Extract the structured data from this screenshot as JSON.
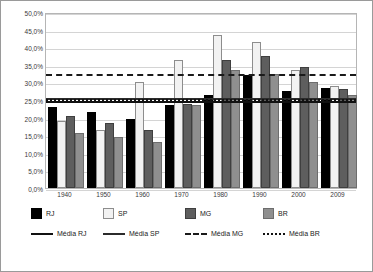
{
  "chart_data": {
    "type": "bar",
    "title": "",
    "xlabel": "",
    "ylabel": "",
    "ylim": [
      0,
      50
    ],
    "grid": true,
    "legend_position": "bottom",
    "categories": [
      "1940",
      "1950",
      "1960",
      "1970",
      "1980",
      "1990",
      "2000",
      "2009"
    ],
    "series": [
      {
        "name": "RJ",
        "values": [
          23.0,
          21.5,
          19.5,
          23.5,
          26.5,
          32.0,
          27.5,
          28.5
        ]
      },
      {
        "name": "SP",
        "values": [
          19.0,
          16.5,
          30.0,
          36.5,
          43.5,
          41.5,
          33.5,
          29.0
        ]
      },
      {
        "name": "MG",
        "values": [
          20.5,
          18.5,
          16.5,
          24.0,
          36.5,
          37.5,
          34.5,
          28.0
        ]
      },
      {
        "name": "BR",
        "values": [
          15.5,
          14.5,
          13.0,
          23.5,
          33.5,
          32.5,
          30.0,
          26.5
        ]
      }
    ],
    "average_lines": [
      {
        "name": "Média RJ",
        "value": 25.3,
        "style": "solid"
      },
      {
        "name": "Média SP",
        "value": 26.2,
        "style": "solid"
      },
      {
        "name": "Média MG",
        "value": 33.0,
        "style": "dashed"
      },
      {
        "name": "Média BR",
        "value": 25.9,
        "style": "dotted"
      }
    ],
    "y_ticks": [
      "0,0%",
      "5,0%",
      "10,0%",
      "15,0%",
      "20,0%",
      "25,0%",
      "30,0%",
      "35,0%",
      "40,0%",
      "45,0%",
      "50,0%"
    ],
    "y_tick_values": [
      0,
      5,
      10,
      15,
      20,
      25,
      30,
      35,
      40,
      45,
      50
    ],
    "colors": {
      "rj": "#000000",
      "sp": "#f2f2f2",
      "mg": "#5e5e5e",
      "br": "#8f8f8f",
      "grid": "#d4d4d4",
      "border": "#9a9a9a"
    }
  },
  "legend": {
    "items": [
      {
        "key": "rj",
        "label": "RJ"
      },
      {
        "key": "sp",
        "label": "SP"
      },
      {
        "key": "mg",
        "label": "MG"
      },
      {
        "key": "br",
        "label": "BR"
      },
      {
        "key": "avg-rj",
        "label": "Média RJ"
      },
      {
        "key": "avg-sp",
        "label": "Média SP"
      },
      {
        "key": "avg-mg",
        "label": "Média MG"
      },
      {
        "key": "avg-br",
        "label": "Média BR"
      }
    ]
  }
}
